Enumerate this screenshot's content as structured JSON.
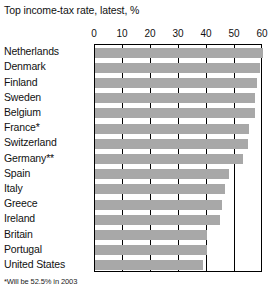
{
  "chart_data": {
    "type": "bar",
    "orientation": "horizontal",
    "title": "Top income-tax rate, latest, %",
    "xlabel": "",
    "ylabel": "",
    "xlim": [
      0,
      60
    ],
    "xticks": [
      0,
      10,
      20,
      30,
      40,
      50,
      60
    ],
    "xtick_labels": [
      "0",
      "10",
      "20",
      "30",
      "40",
      "50",
      "60"
    ],
    "grid": true,
    "legend": null,
    "bar_color": "#a8a8a8",
    "categories": [
      "Netherlands",
      "Denmark",
      "Finland",
      "Sweden",
      "Belgium",
      "France*",
      "Switzerland",
      "Germany**",
      "Spain",
      "Italy",
      "Greece",
      "Ireland",
      "Britain",
      "Portugal",
      "United States"
    ],
    "values": [
      60,
      59,
      58,
      57,
      57,
      55,
      54.5,
      53,
      48,
      46.5,
      45.5,
      44.5,
      40,
      40,
      38.6
    ],
    "footnote": "*Will be 52.5% in 2003"
  }
}
